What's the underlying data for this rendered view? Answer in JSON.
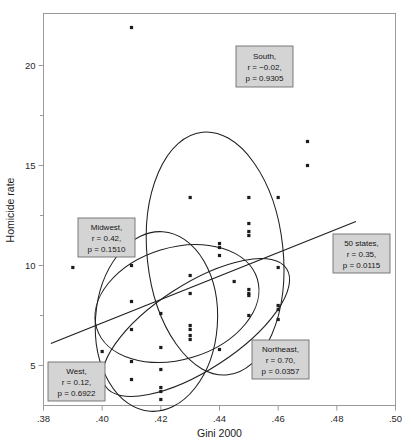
{
  "chart_data": {
    "type": "scatter",
    "title": "",
    "xlabel": "Gini 2000",
    "ylabel": "Homicide rate",
    "xlim": [
      0.38,
      0.5
    ],
    "ylim": [
      3.0,
      22.6
    ],
    "grid": false,
    "legend_position": "none",
    "xticks": [
      {
        "value": 0.38,
        "label": ".38"
      },
      {
        "value": 0.4,
        "label": ".40"
      },
      {
        "value": 0.42,
        "label": ".42"
      },
      {
        "value": 0.44,
        "label": ".44"
      },
      {
        "value": 0.46,
        "label": ".46"
      },
      {
        "value": 0.48,
        "label": ".48"
      },
      {
        "value": 0.5,
        "label": ".50"
      }
    ],
    "yticks_major": [
      {
        "value": 5,
        "label": "5"
      },
      {
        "value": 10,
        "label": "10"
      },
      {
        "value": 15,
        "label": "15"
      },
      {
        "value": 20,
        "label": "20"
      }
    ],
    "yticks_minor": [
      7.5,
      12.5,
      17.5
    ],
    "points": [
      {
        "x": 0.41,
        "y": 21.9
      },
      {
        "x": 0.47,
        "y": 16.2
      },
      {
        "x": 0.47,
        "y": 15.0
      },
      {
        "x": 0.43,
        "y": 13.4
      },
      {
        "x": 0.45,
        "y": 13.4
      },
      {
        "x": 0.46,
        "y": 13.4
      },
      {
        "x": 0.45,
        "y": 12.1
      },
      {
        "x": 0.45,
        "y": 11.7
      },
      {
        "x": 0.45,
        "y": 11.5
      },
      {
        "x": 0.44,
        "y": 11.1
      },
      {
        "x": 0.44,
        "y": 10.9
      },
      {
        "x": 0.44,
        "y": 10.5
      },
      {
        "x": 0.41,
        "y": 10.0
      },
      {
        "x": 0.39,
        "y": 9.9
      },
      {
        "x": 0.46,
        "y": 9.9
      },
      {
        "x": 0.43,
        "y": 9.5
      },
      {
        "x": 0.445,
        "y": 9.2
      },
      {
        "x": 0.45,
        "y": 8.8
      },
      {
        "x": 0.45,
        "y": 8.6
      },
      {
        "x": 0.45,
        "y": 8.5
      },
      {
        "x": 0.43,
        "y": 8.6
      },
      {
        "x": 0.41,
        "y": 8.2
      },
      {
        "x": 0.46,
        "y": 8.0
      },
      {
        "x": 0.46,
        "y": 7.8
      },
      {
        "x": 0.42,
        "y": 7.6
      },
      {
        "x": 0.45,
        "y": 7.5
      },
      {
        "x": 0.46,
        "y": 7.3
      },
      {
        "x": 0.43,
        "y": 7.0
      },
      {
        "x": 0.43,
        "y": 6.8
      },
      {
        "x": 0.41,
        "y": 6.8
      },
      {
        "x": 0.43,
        "y": 6.5
      },
      {
        "x": 0.43,
        "y": 6.3
      },
      {
        "x": 0.42,
        "y": 5.9
      },
      {
        "x": 0.44,
        "y": 5.8
      },
      {
        "x": 0.4,
        "y": 5.7
      },
      {
        "x": 0.41,
        "y": 5.2
      },
      {
        "x": 0.42,
        "y": 4.8
      },
      {
        "x": 0.41,
        "y": 4.3
      },
      {
        "x": 0.42,
        "y": 3.9
      },
      {
        "x": 0.42,
        "y": 3.7
      },
      {
        "x": 0.4,
        "y": 3.4
      },
      {
        "x": 0.42,
        "y": 3.3
      }
    ],
    "regression_line": {
      "x1": 0.3825,
      "y1": 6.1,
      "x2": 0.4865,
      "y2": 12.2
    },
    "ellipses": [
      {
        "group": "South",
        "cx": 0.4385,
        "cy": 10.6,
        "rx_px": 68,
        "ry_px": 122,
        "rotation": -6
      },
      {
        "group": "Midwest",
        "cx": 0.4255,
        "cy": 8.1,
        "rx_px": 84,
        "ry_px": 56,
        "rotation": -17
      },
      {
        "group": "West",
        "cx": 0.4185,
        "cy": 7.2,
        "rx_px": 61,
        "ry_px": 90,
        "rotation": 4
      },
      {
        "group": "Northeast",
        "cx": 0.432,
        "cy": 6.9,
        "rx_px": 108,
        "ry_px": 43,
        "rotation": -33
      }
    ],
    "annotations": [
      {
        "id": "south",
        "lines": [
          "South,",
          "r = −0.02,",
          "p = 0.9305"
        ],
        "box": {
          "x": 236,
          "y": 46,
          "w": 57,
          "h": 41
        }
      },
      {
        "id": "midwest",
        "lines": [
          "Midwest,",
          "r = 0.42,",
          "p = 0.1510"
        ],
        "box": {
          "x": 78,
          "y": 218,
          "w": 57,
          "h": 39
        }
      },
      {
        "id": "fifty",
        "lines": [
          "50 states,",
          "r = 0.35,",
          "p = 0.0115"
        ],
        "box": {
          "x": 333,
          "y": 234,
          "w": 57,
          "h": 39
        }
      },
      {
        "id": "northeast",
        "lines": [
          "Northeast,",
          "r = 0.70,",
          "p = 0.0357"
        ],
        "box": {
          "x": 252,
          "y": 340,
          "w": 57,
          "h": 39
        }
      },
      {
        "id": "west",
        "lines": [
          "West,",
          "r = 0.12,",
          "p = 0.6922"
        ],
        "box": {
          "x": 48,
          "y": 362,
          "w": 57,
          "h": 39
        }
      }
    ]
  },
  "axes": {
    "x_title": "Gini 2000",
    "y_title": "Homicide rate"
  },
  "colors": {
    "point": "#1c1c1c",
    "ellipse": "#1f1f1f",
    "line": "#1f1f1f",
    "frame": "#9a9a9a",
    "label_box_fill": "#d4d4d4",
    "label_box_stroke": "#6e6e6e",
    "background": "#ffffff"
  }
}
